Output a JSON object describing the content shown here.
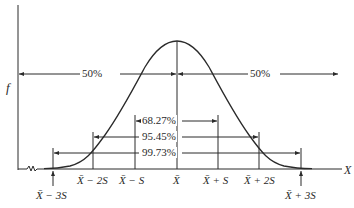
{
  "axis": {
    "y_label": "f",
    "x_label": "X"
  },
  "halves": {
    "left_label": "50%",
    "right_label": "50%"
  },
  "intervals": [
    {
      "label": "68.27%",
      "from": "X̄ − S",
      "to": "X̄ + S"
    },
    {
      "label": "95.45%",
      "from": "X̄ − 2S",
      "to": "X̄ + 2S"
    },
    {
      "label": "99.73%",
      "from": "X̄ − 3S",
      "to": "X̄ + 3S"
    }
  ],
  "ticks": {
    "m3": "X̄ − 3S",
    "m2": "X̄ − 2S",
    "m1": "X̄ − S",
    "mean": "X̄",
    "p1": "X̄ + S",
    "p2": "X̄ + 2S",
    "p3": "X̄ + 3S"
  },
  "colors": {
    "ink": "#2a2a2a",
    "background": "#ffffff"
  }
}
